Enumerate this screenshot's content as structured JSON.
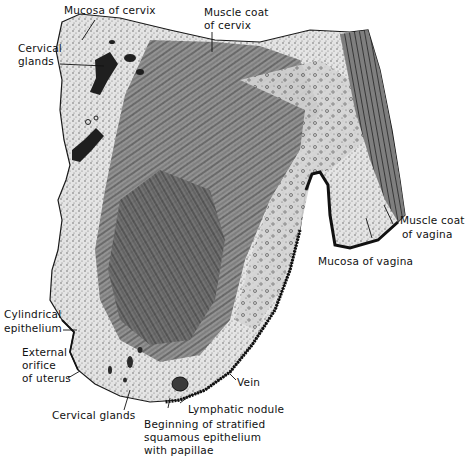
{
  "figure": {
    "colors": {
      "background": "#ffffff",
      "ink": "#111111",
      "tissue_light": "#d9d9d9",
      "tissue_mid": "#9a9a9a",
      "tissue_dark": "#4a4a4a",
      "epithelium": "#1a1a1a"
    },
    "labels": {
      "mucosa_of_cervix": "Mucosa of cervix",
      "cervical_glands_top_line1": "Cervical",
      "cervical_glands_top_line2": "glands",
      "muscle_coat_of_cervix_line1": "Muscle coat",
      "muscle_coat_of_cervix_line2": "of cervix",
      "muscle_coat_of_vagina_line1": "Muscle coat",
      "muscle_coat_of_vagina_line2": "of vagina",
      "mucosa_of_vagina": "Mucosa of vagina",
      "cylindrical_epithelium_line1": "Cylindrical",
      "cylindrical_epithelium_line2": "epithelium",
      "external_orifice_line1": "External",
      "external_orifice_line2": "orifice",
      "external_orifice_line3": "of uterus",
      "cervical_glands_bottom": "Cervical glands",
      "vein": "Vein",
      "lymphatic_nodule": "Lymphatic nodule",
      "stratified_epithelium_line1": "Beginning of stratified",
      "stratified_epithelium_line2": "squamous epithelium",
      "stratified_epithelium_line3": "with papillae"
    }
  }
}
